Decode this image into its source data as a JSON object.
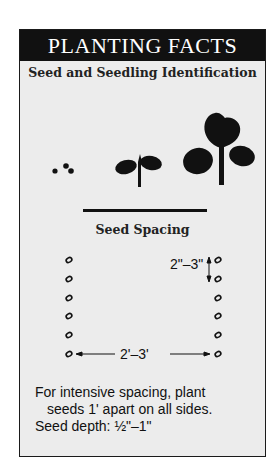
{
  "card": {
    "title": "PLANTING FACTS",
    "section1_heading": "Seed and Seedling Identification",
    "section2_heading": "Seed Spacing",
    "vertical_spacing_label": "2\"–3\"",
    "horizontal_spacing_label": "2'–3'",
    "notes": [
      "For intensive spacing, plant",
      "seeds 1' apart on all sides.",
      "Seed depth: ½\"–1\""
    ]
  },
  "illustrations": [
    "seeds-icon",
    "small-seedling-icon",
    "large-seedling-icon"
  ],
  "colors": {
    "header_bg": "#111111",
    "card_bg": "#ececec",
    "ink": "#111111"
  }
}
